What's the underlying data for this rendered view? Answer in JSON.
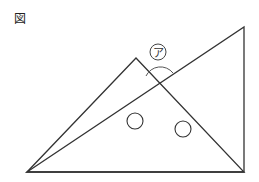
{
  "figure": {
    "label": "図",
    "angle_label": "ア",
    "stroke_color": "#333333",
    "arc_color": "#555555",
    "triangles": [
      {
        "name": "left-triangle",
        "points": [
          [
            27,
            172
          ],
          [
            136,
            58
          ],
          [
            244,
            172
          ]
        ]
      },
      {
        "name": "right-triangle",
        "points": [
          [
            27,
            172
          ],
          [
            244,
            27
          ],
          [
            244,
            172
          ]
        ]
      }
    ],
    "angle_marker": {
      "center": [
        159,
        81
      ],
      "radius": 13
    },
    "label_circle": {
      "center": [
        158,
        52
      ],
      "radius": 8
    },
    "marks": [
      {
        "name": "angle-mark-left",
        "center": [
          135,
          121
        ],
        "radius": 8
      },
      {
        "name": "angle-mark-right",
        "center": [
          183,
          129
        ],
        "radius": 8
      }
    ]
  }
}
